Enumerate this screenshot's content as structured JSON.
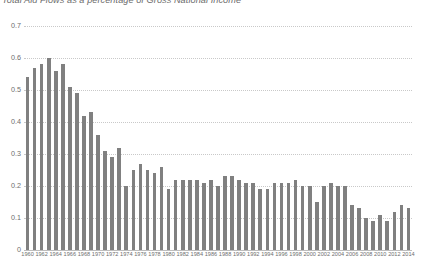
{
  "chart_data": {
    "type": "bar",
    "title": "Total Aid Flows as a percentage of Gross National Income",
    "xlabel": "",
    "ylabel": "",
    "ylim": [
      0,
      0.7
    ],
    "ytick_values": [
      0,
      0.1,
      0.2,
      0.3,
      0.4,
      0.5,
      0.6,
      0.7
    ],
    "ytick_labels": [
      "0",
      "0.1",
      "0.2",
      "0.3",
      "0.4",
      "0.5",
      "0.6",
      "0.7"
    ],
    "grid": true,
    "legend": false,
    "bar_color": "#808080",
    "xtick_step": 2,
    "xtick_labels": [
      "1960",
      "1962",
      "1964",
      "1966",
      "1968",
      "1970",
      "1972",
      "1974",
      "1976",
      "1978",
      "1980",
      "1982",
      "1984",
      "1986",
      "1988",
      "1990",
      "1992",
      "1994",
      "1996",
      "1998",
      "2000",
      "2002",
      "2004",
      "2006",
      "2008",
      "2010",
      "2012",
      "2014"
    ],
    "categories": [
      "1960",
      "1961",
      "1962",
      "1963",
      "1964",
      "1965",
      "1966",
      "1967",
      "1968",
      "1969",
      "1970",
      "1971",
      "1972",
      "1973",
      "1974",
      "1975",
      "1976",
      "1977",
      "1978",
      "1979",
      "1980",
      "1981",
      "1982",
      "1983",
      "1984",
      "1985",
      "1986",
      "1987",
      "1988",
      "1989",
      "1990",
      "1991",
      "1992",
      "1993",
      "1994",
      "1995",
      "1996",
      "1997",
      "1998",
      "1999",
      "2000",
      "2001",
      "2002",
      "2003",
      "2004",
      "2005",
      "2006",
      "2007",
      "2008",
      "2009",
      "2010",
      "2011",
      "2012",
      "2013",
      "2014"
    ],
    "values": [
      0.54,
      0.57,
      0.58,
      0.6,
      0.56,
      0.58,
      0.51,
      0.49,
      0.42,
      0.43,
      0.36,
      0.31,
      0.29,
      0.32,
      0.2,
      0.25,
      0.27,
      0.25,
      0.24,
      0.26,
      0.19,
      0.22,
      0.22,
      0.22,
      0.22,
      0.21,
      0.22,
      0.2,
      0.23,
      0.23,
      0.22,
      0.21,
      0.21,
      0.19,
      0.19,
      0.21,
      0.21,
      0.21,
      0.22,
      0.2,
      0.2,
      0.15,
      0.2,
      0.21,
      0.2,
      0.2,
      0.14,
      0.13,
      0.1,
      0.09,
      0.11,
      0.09,
      0.12,
      0.14,
      0.13
    ]
  }
}
